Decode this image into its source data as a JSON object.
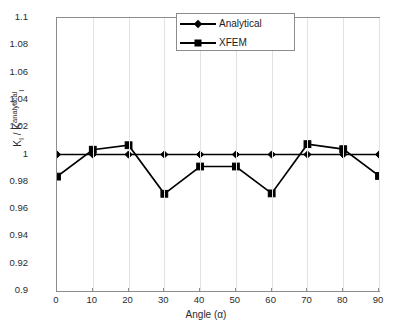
{
  "chart_data": {
    "type": "line",
    "title": "",
    "xlabel": "Angle (α)",
    "ylabel": "K_I / K_I^analytical",
    "ylabel_parts": {
      "lead": "K",
      "lead_sub": "I",
      "mid": " / K",
      "mid_sub": "I",
      "mid_sup": "analytical"
    },
    "x": [
      0,
      10,
      20,
      30,
      40,
      50,
      60,
      70,
      80,
      90
    ],
    "xlim": [
      0,
      90
    ],
    "ylim": [
      0.9,
      1.1
    ],
    "xticks": [
      0,
      10,
      20,
      30,
      40,
      50,
      60,
      70,
      80,
      90
    ],
    "yticks": [
      0.9,
      0.92,
      0.94,
      0.96,
      0.98,
      1,
      1.02,
      1.04,
      1.06,
      1.08,
      1.1
    ],
    "ytick_labels": [
      "0.9",
      "0.92",
      "0.94",
      "0.96",
      "0.98",
      "1",
      "1.02",
      "1.04",
      "1.06",
      "1.08",
      "1.1"
    ],
    "xtick_labels": [
      "0",
      "10",
      "20",
      "30",
      "40",
      "50",
      "60",
      "70",
      "80",
      "90"
    ],
    "grid": {
      "vertical": true,
      "horizontal": false,
      "color": "#e2e2e2"
    },
    "legend": {
      "position": "top-center",
      "border": true
    },
    "series": [
      {
        "name": "Analytical",
        "marker": "diamond",
        "color": "#000000",
        "values": [
          1.0,
          1.0,
          1.0,
          1.0,
          1.0,
          1.0,
          1.0,
          1.0,
          1.0,
          1.0
        ]
      },
      {
        "name": "XFEM",
        "marker": "square",
        "color": "#000000",
        "values": [
          0.9838,
          1.0035,
          1.0068,
          0.9712,
          0.9912,
          0.9912,
          0.9715,
          1.0076,
          1.0039,
          0.9843
        ]
      }
    ]
  },
  "axes": {
    "frame_color": "#8c8c8c",
    "background": "#ffffff"
  }
}
